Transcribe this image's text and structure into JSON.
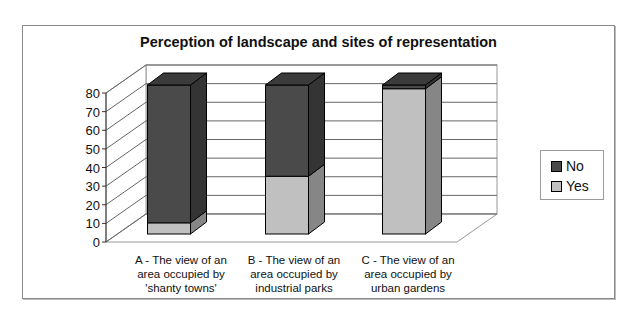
{
  "chart_data": {
    "type": "bar",
    "subtype": "stacked-3d-column",
    "title": "Perception of landscape and sites of representation",
    "categories": [
      "A - The view of an area occupied by 'shanty towns'",
      "B - The view of an area occupied by industrial parks",
      "C - The view of an area occupied by urban gardens"
    ],
    "series": [
      {
        "name": "Yes",
        "values": [
          6,
          31,
          78
        ],
        "color": "#c0c0c0"
      },
      {
        "name": "No",
        "values": [
          74,
          49,
          2
        ],
        "color": "#4a4a4a"
      }
    ],
    "xlabel": "",
    "ylabel": "",
    "ylim": [
      0,
      80
    ],
    "yticks": [
      0,
      10,
      20,
      30,
      40,
      50,
      60,
      70,
      80
    ],
    "grid": true,
    "legend_position": "right"
  },
  "title": "Perception of landscape and sites of representation",
  "categories": [
    {
      "line1": "A - The view of an",
      "line2": "area occupied by",
      "line3": "'shanty towns'"
    },
    {
      "line1": "B - The view of an",
      "line2": "area occupied by",
      "line3": "industrial parks"
    },
    {
      "line1": "C - The view of an",
      "line2": "area occupied by",
      "line3": "urban gardens"
    }
  ],
  "yticks": [
    "0",
    "10",
    "20",
    "30",
    "40",
    "50",
    "60",
    "70",
    "80"
  ],
  "legend": [
    {
      "label": "No",
      "color": "#4a4a4a"
    },
    {
      "label": "Yes",
      "color": "#c0c0c0"
    }
  ]
}
